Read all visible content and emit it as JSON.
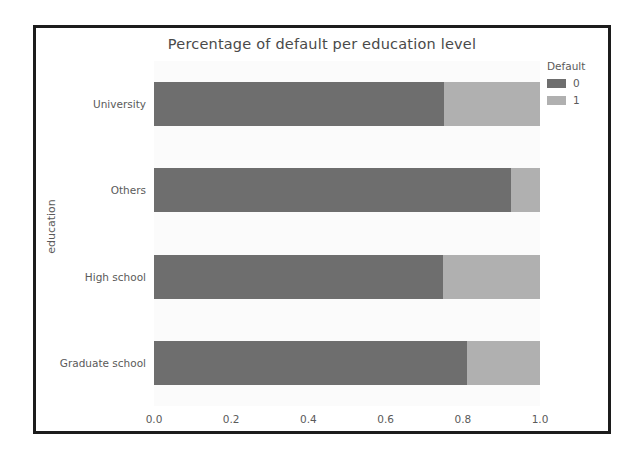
{
  "chart_data": {
    "type": "bar",
    "orientation": "horizontal",
    "stacked": true,
    "normalized": true,
    "title": "Percentage of default per education level",
    "xlabel": "",
    "ylabel": "education",
    "categories": [
      "Graduate school",
      "High school",
      "Others",
      "University"
    ],
    "series": [
      {
        "name": "0",
        "values": [
          0.81,
          0.748,
          0.925,
          0.75
        ],
        "color": "#6e6e6e"
      },
      {
        "name": "1",
        "values": [
          0.19,
          0.252,
          0.075,
          0.25
        ],
        "color": "#b0b0b0"
      }
    ],
    "xlim": [
      0.0,
      1.0
    ],
    "xticks": [
      "0.0",
      "0.2",
      "0.4",
      "0.6",
      "0.8",
      "1.0"
    ],
    "xtick_values": [
      0.0,
      0.2,
      0.4,
      0.6,
      0.8,
      1.0
    ],
    "grid": false,
    "legend": {
      "title": "Default",
      "position": "right",
      "entries": [
        "0",
        "1"
      ]
    },
    "panel_color": "#fbfbfb",
    "text_color": "#5a5a5a"
  }
}
